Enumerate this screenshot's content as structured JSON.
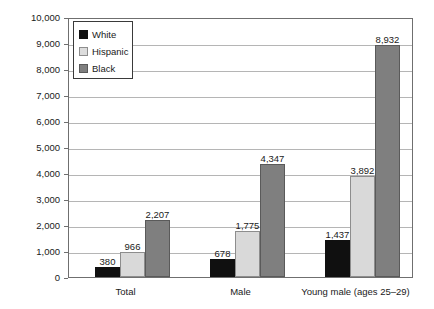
{
  "chart_data": {
    "type": "bar",
    "title": "",
    "xlabel": "",
    "ylabel": "Rate per 100,000 people in each group",
    "ylim": [
      0,
      10000
    ],
    "ytick_step": 1000,
    "grid": true,
    "legend_position": "upper-left-inside",
    "categories": [
      "Total",
      "Male",
      "Young male (ages 25–29)"
    ],
    "series": [
      {
        "name": "White",
        "color": "#101010",
        "values": [
          380,
          678,
          1437
        ]
      },
      {
        "name": "Hispanic",
        "color": "#d9d9d9",
        "values": [
          966,
          1775,
          3892
        ]
      },
      {
        "name": "Black",
        "color": "#7f7f7f",
        "values": [
          2207,
          4347,
          8932
        ]
      }
    ],
    "value_labels": {
      "Total": [
        "380",
        "966",
        "2,207"
      ],
      "Male": [
        "678",
        "1,775",
        "4,347"
      ],
      "Young male (ages 25–29)": [
        "1,437",
        "3,892",
        "8,932"
      ]
    },
    "ytick_labels": [
      "10,000",
      "9,000",
      "8,000",
      "7,000",
      "6,000",
      "5,000",
      "4,000",
      "3,000",
      "2,000",
      "1,000",
      "0"
    ]
  },
  "axes": {
    "y_title": "Rate per 100,000 people in each group",
    "ticks": [
      {
        "label": "10,000",
        "value": 10000
      },
      {
        "label": "9,000",
        "value": 9000
      },
      {
        "label": "8,000",
        "value": 8000
      },
      {
        "label": "7,000",
        "value": 7000
      },
      {
        "label": "6,000",
        "value": 6000
      },
      {
        "label": "5,000",
        "value": 5000
      },
      {
        "label": "4,000",
        "value": 4000
      },
      {
        "label": "3,000",
        "value": 3000
      },
      {
        "label": "2,000",
        "value": 2000
      },
      {
        "label": "1,000",
        "value": 1000
      },
      {
        "label": "0",
        "value": 0
      }
    ]
  },
  "legend": {
    "items": [
      {
        "label": "White",
        "swatch": "white-series"
      },
      {
        "label": "Hispanic",
        "swatch": "hispanic-series"
      },
      {
        "label": "Black",
        "swatch": "black-series"
      }
    ]
  },
  "title_strip": ""
}
